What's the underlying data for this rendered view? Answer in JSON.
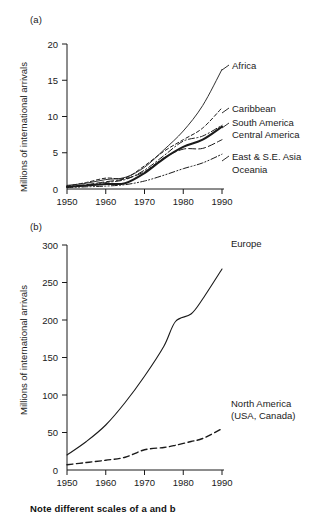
{
  "figure": {
    "note": "Note different scales of a and b",
    "panel_a_label": "(a)",
    "panel_b_label": "(b)",
    "y_axis_title": "Millions of international arrivals",
    "ink_color": "#1a1a1a"
  },
  "chart_data": [
    {
      "id": "panel-a",
      "type": "line",
      "title": "(a)",
      "xlabel": "",
      "ylabel": "Millions of international arrivals",
      "xlim": [
        1950,
        1990
      ],
      "ylim": [
        0,
        20
      ],
      "xticks": [
        1950,
        1960,
        1970,
        1980,
        1990
      ],
      "yticks": [
        0,
        5,
        10,
        15,
        20
      ],
      "grid": false,
      "legend_position": "right-of-plot (direct line labels)",
      "x": [
        1950,
        1955,
        1960,
        1965,
        1970,
        1975,
        1980,
        1985,
        1990
      ],
      "series": [
        {
          "name": "Africa",
          "style": "solid-thin",
          "values": [
            0.5,
            0.8,
            1.3,
            1.6,
            3.0,
            5.4,
            8.0,
            11.5,
            16.5
          ]
        },
        {
          "name": "Caribbean",
          "style": "short-dash",
          "values": [
            0.4,
            0.9,
            1.5,
            1.5,
            3.2,
            5.2,
            6.8,
            8.4,
            11.2
          ]
        },
        {
          "name": "South America",
          "style": "dash-dot",
          "values": [
            0.3,
            0.5,
            0.9,
            1.3,
            2.6,
            4.6,
            6.6,
            7.3,
            8.8
          ]
        },
        {
          "name": "Central America",
          "style": "solid-thick",
          "values": [
            0.3,
            0.5,
            0.7,
            0.8,
            2.2,
            4.2,
            5.8,
            6.8,
            8.6
          ]
        },
        {
          "name": "East & S.E. Asia",
          "style": "long-dash",
          "values": [
            0.3,
            0.6,
            1.0,
            1.4,
            2.4,
            4.3,
            5.5,
            5.6,
            6.8
          ]
        },
        {
          "name": "Oceania",
          "style": "dash-dot-dot",
          "values": [
            0.2,
            0.3,
            0.4,
            0.6,
            1.1,
            1.9,
            2.8,
            3.6,
            4.8
          ]
        }
      ]
    },
    {
      "id": "panel-b",
      "type": "line",
      "title": "(b)",
      "xlabel": "",
      "ylabel": "Millions of international arrivals",
      "xlim": [
        1950,
        1990
      ],
      "ylim": [
        0,
        300
      ],
      "xticks": [
        1950,
        1960,
        1970,
        1980,
        1990
      ],
      "yticks": [
        0,
        50,
        100,
        150,
        200,
        250,
        300
      ],
      "grid": false,
      "legend_position": "right-of-plot (direct line labels)",
      "x": [
        1950,
        1955,
        1960,
        1965,
        1970,
        1975,
        1978,
        1982,
        1985,
        1990
      ],
      "series": [
        {
          "name": "Europe",
          "style": "solid",
          "values": [
            20,
            38,
            60,
            90,
            125,
            165,
            198,
            208,
            228,
            268
          ]
        },
        {
          "name": "North America (USA, Canada)",
          "name_line1": "North America",
          "name_line2": "(USA, Canada)",
          "style": "dashed",
          "values": [
            7,
            10,
            13,
            17,
            27,
            30,
            33,
            38,
            42,
            55
          ]
        }
      ]
    }
  ]
}
